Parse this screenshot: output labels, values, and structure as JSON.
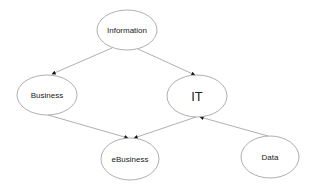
{
  "diagram": {
    "type": "directed-graph",
    "nodes": [
      {
        "id": "information",
        "label": "Information",
        "cx": 127,
        "cy": 30,
        "rx": 30,
        "ry": 20,
        "font_size": 8
      },
      {
        "id": "business",
        "label": "Business",
        "cx": 47,
        "cy": 95,
        "rx": 30,
        "ry": 20,
        "font_size": 8
      },
      {
        "id": "it",
        "label": "IT",
        "cx": 197,
        "cy": 96,
        "rx": 30,
        "ry": 21,
        "font_size": 13
      },
      {
        "id": "ebusiness",
        "label": "eBusiness",
        "cx": 130,
        "cy": 159,
        "rx": 29,
        "ry": 21,
        "font_size": 8
      },
      {
        "id": "data",
        "label": "Data",
        "cx": 270,
        "cy": 157,
        "rx": 29,
        "ry": 21,
        "font_size": 8
      }
    ],
    "edges": [
      {
        "from": "information",
        "to": "business"
      },
      {
        "from": "information",
        "to": "it"
      },
      {
        "from": "business",
        "to": "ebusiness"
      },
      {
        "from": "it",
        "to": "ebusiness"
      },
      {
        "from": "data",
        "to": "it"
      }
    ],
    "colors": {
      "stroke": "#9a9a9a",
      "text": "#222222",
      "arrow": "#111111",
      "background": "#ffffff"
    }
  }
}
